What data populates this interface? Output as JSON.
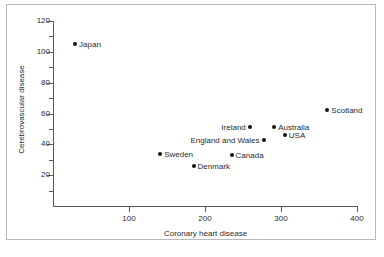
{
  "figure": {
    "background_color": "#ffffff",
    "frame_color": "#b9b9b9",
    "axis_color": "#595959",
    "marker_color": "#111111",
    "text_color": "#2b2b2b"
  },
  "chart_data": {
    "type": "scatter",
    "title": "",
    "xlabel": "Coronary heart disease",
    "ylabel": "Cerebrovascular disease",
    "xlim": [
      0,
      400
    ],
    "ylim": [
      0,
      120
    ],
    "grid": false,
    "legend": "none",
    "xticks": [
      100,
      200,
      300,
      400
    ],
    "yticks": [
      20,
      40,
      60,
      80,
      100,
      120
    ],
    "x_minor_ticks": [],
    "y_minor_ticks": [
      10,
      30,
      50,
      70,
      90,
      110
    ],
    "points": [
      {
        "label": "Japan",
        "x": 29,
        "y": 105,
        "label_side": "right"
      },
      {
        "label": "Sweden",
        "x": 141,
        "y": 34,
        "label_side": "right"
      },
      {
        "label": "Denmark",
        "x": 185,
        "y": 26,
        "label_side": "right"
      },
      {
        "label": "Canada",
        "x": 235,
        "y": 33,
        "label_side": "right"
      },
      {
        "label": "Ireland",
        "x": 259,
        "y": 51,
        "label_side": "left"
      },
      {
        "label": "England and Wales",
        "x": 277,
        "y": 43,
        "label_side": "left"
      },
      {
        "label": "Australia",
        "x": 291,
        "y": 51,
        "label_side": "right"
      },
      {
        "label": "USA",
        "x": 305,
        "y": 46,
        "label_side": "right"
      },
      {
        "label": "Scotland",
        "x": 361,
        "y": 62,
        "label_side": "right"
      }
    ]
  }
}
